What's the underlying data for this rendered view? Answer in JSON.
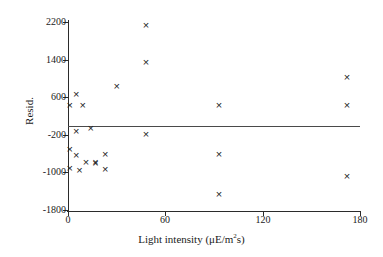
{
  "chart_data": {
    "type": "scatter",
    "title": "",
    "xlabel": "Light intensity (μE/m²s)",
    "xlabel_prefix": "Light intensity (μE/m",
    "xlabel_sup": "2",
    "xlabel_suffix": "s)",
    "ylabel": "Resid.",
    "xlim": [
      0,
      180
    ],
    "ylim": [
      -1800,
      2200
    ],
    "xticks": [
      0,
      60,
      120,
      180
    ],
    "xtick_labels": [
      "0",
      "60",
      "120",
      "180"
    ],
    "yticks": [
      -1800,
      -1000,
      -200,
      600,
      1400,
      2200
    ],
    "ytick_labels": [
      "-1800",
      "-1000",
      "-200",
      "600",
      "1400",
      "2200"
    ],
    "grid": false,
    "legend": null,
    "marker": "x",
    "marker_color": "#222222",
    "reference_line": {
      "orientation": "horizontal",
      "y": -20,
      "color": "#4a4a4a"
    },
    "points": [
      {
        "x": 1,
        "y": 420
      },
      {
        "x": 5,
        "y": 660
      },
      {
        "x": 9,
        "y": 430
      },
      {
        "x": 5,
        "y": -140
      },
      {
        "x": 14,
        "y": -60
      },
      {
        "x": 1,
        "y": -520
      },
      {
        "x": 5,
        "y": -640
      },
      {
        "x": 1,
        "y": -920
      },
      {
        "x": 7,
        "y": -960
      },
      {
        "x": 11,
        "y": -790
      },
      {
        "x": 17,
        "y": -790
      },
      {
        "x": 17,
        "y": -810
      },
      {
        "x": 23,
        "y": -610
      },
      {
        "x": 23,
        "y": -930
      },
      {
        "x": 30,
        "y": 830
      },
      {
        "x": 48,
        "y": 2120
      },
      {
        "x": 48,
        "y": 1340
      },
      {
        "x": 48,
        "y": -190
      },
      {
        "x": 93,
        "y": 430
      },
      {
        "x": 93,
        "y": -610
      },
      {
        "x": 93,
        "y": -1480
      },
      {
        "x": 172,
        "y": 1010
      },
      {
        "x": 172,
        "y": 420
      },
      {
        "x": 172,
        "y": -1090
      }
    ]
  }
}
